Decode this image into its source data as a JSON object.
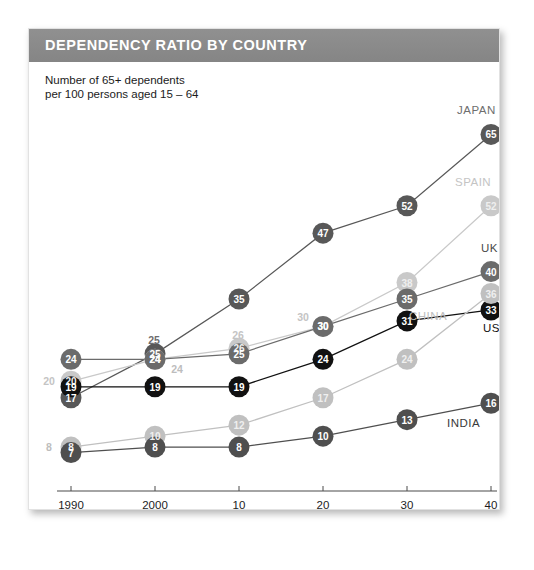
{
  "card": {
    "title": "DEPENDENCY RATIO BY COUNTRY",
    "subtitle": "Number of 65+ dependents\nper 100 persons aged 15 – 64",
    "forecast_note": "Figures from 2010 are forecasts"
  },
  "chart_data": {
    "type": "line",
    "title": "DEPENDENCY RATIO BY COUNTRY",
    "subtitle": "Number of 65+ dependents per 100 persons aged 15 – 64",
    "xlabel": "",
    "ylabel": "Dependents per 100 persons aged 15-64",
    "x": [
      1990,
      2000,
      2010,
      2020,
      2030,
      2040
    ],
    "tick_labels": [
      "1990",
      "2000",
      "10",
      "20",
      "30",
      "40"
    ],
    "ylim": [
      0,
      70
    ],
    "xlim": [
      1986,
      2043
    ],
    "grid": false,
    "legend": "right-edge-series-labels",
    "annotations": [
      "Figures from 2010 are forecasts"
    ],
    "series": [
      {
        "name": "JAPAN",
        "color": "#585858",
        "label_color": "#6e6e6e",
        "values": [
          17,
          25,
          35,
          47,
          52,
          65
        ],
        "shown_labels": [
          "17",
          "25",
          "35",
          "47",
          "52",
          "65"
        ]
      },
      {
        "name": "SPAIN",
        "color": "#c9c9c9",
        "label_color": "#c4c4c4",
        "values": [
          20,
          24,
          26,
          30,
          38,
          52
        ],
        "shown_labels": [
          "20",
          "24",
          "26",
          "30",
          "38",
          "52"
        ]
      },
      {
        "name": "UK",
        "color": "#6b6b6b",
        "label_color": "#4a4a4a",
        "values": [
          24,
          24,
          25,
          30,
          35,
          40
        ],
        "shown_labels": [
          "24",
          "24",
          "25",
          "30",
          "35",
          "40"
        ]
      },
      {
        "name": "US",
        "color": "#111111",
        "label_color": "#111111",
        "values": [
          19,
          19,
          19,
          24,
          31,
          33
        ],
        "shown_labels": [
          "19",
          "19",
          "19",
          "24",
          "31",
          "33"
        ]
      },
      {
        "name": "CHINA",
        "color": "#c0c0c0",
        "label_color": "#bdbdbd",
        "values": [
          8,
          10,
          12,
          17,
          24,
          36
        ],
        "shown_labels": [
          "8",
          "10",
          "12",
          "17",
          "24",
          "36"
        ]
      },
      {
        "name": "INDIA",
        "color": "#4f4f4f",
        "label_color": "#3a3a3a",
        "values": [
          7,
          8,
          8,
          10,
          13,
          16
        ],
        "shown_labels": [
          "7",
          "8",
          "8",
          "10",
          "13",
          "16"
        ]
      }
    ]
  }
}
